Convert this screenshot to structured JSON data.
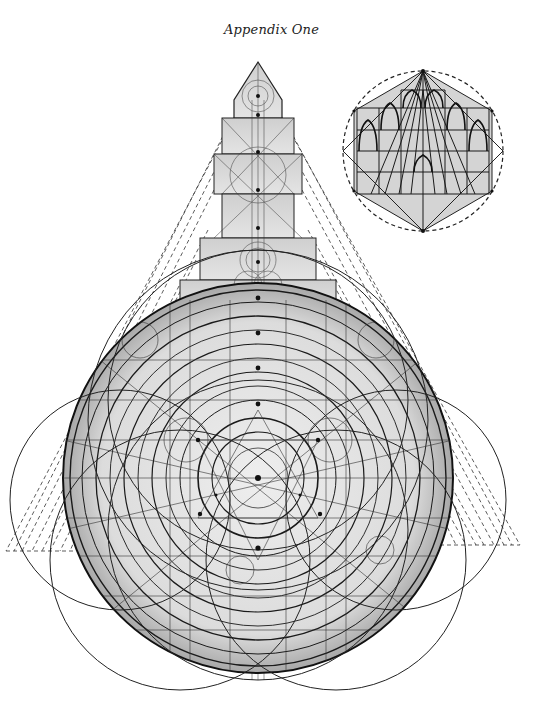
{
  "page": {
    "caption": "Appendix One"
  },
  "figure": {
    "main_diagram": {
      "description": "Geometric construction of a stupa/dome plan: a large circle with concentric rings, a stepped spire above, and dashed triangular projection lines on both sides",
      "circle_center": [
        258,
        478
      ],
      "circle_radius": 195,
      "spire_apex": [
        258,
        62
      ],
      "fill_color": "#d8d8d8",
      "line_color": "#1a1a1a"
    },
    "inset_diagram": {
      "description": "Hexagon inscribed in a dashed circle, containing a grid of pointed (gothic) arches and diagonal lines",
      "center": [
        423,
        151
      ],
      "radius": 80,
      "border_style": "dashed"
    },
    "projection_lines": {
      "left_base_y": 551,
      "right_base_y": 545,
      "style": "dashed"
    }
  }
}
